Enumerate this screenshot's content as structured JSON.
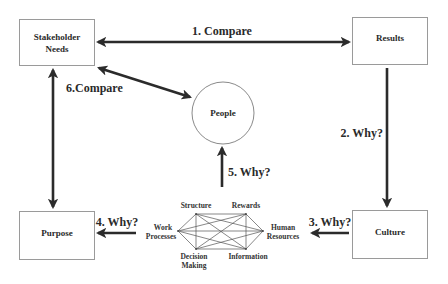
{
  "diagram": {
    "nodes": {
      "stakeholder_needs": {
        "line1": "Stakeholder",
        "line2": "Needs"
      },
      "results": {
        "label": "Results"
      },
      "purpose": {
        "label": "Purpose"
      },
      "culture": {
        "label": "Culture"
      },
      "people": {
        "label": "People"
      }
    },
    "edges": {
      "compare_1": {
        "label": "1. Compare",
        "from": "Stakeholder Needs",
        "to": "Results",
        "direction": "both"
      },
      "why_2": {
        "label": "2. Why?",
        "from": "Results",
        "to": "Culture",
        "direction": "forward"
      },
      "why_3": {
        "label": "3. Why?",
        "from": "Culture",
        "to": "Organization Elements",
        "direction": "forward"
      },
      "why_4": {
        "label": "4. Why?",
        "from": "Organization Elements",
        "to": "Purpose",
        "direction": "forward"
      },
      "why_5": {
        "label": "5. Why?",
        "from": "Organization Elements",
        "to": "People",
        "direction": "forward"
      },
      "compare_6": {
        "label": "6.Compare",
        "from": "Stakeholder Needs",
        "to": "People",
        "direction": "both"
      },
      "purpose_link": {
        "label": "",
        "from": "Stakeholder Needs",
        "to": "Purpose",
        "direction": "both"
      }
    },
    "hexagon": {
      "structure": "Structure",
      "rewards": "Rewards",
      "work_processes_1": "Work",
      "work_processes_2": "Processes",
      "human_resources_1": "Human",
      "human_resources_2": "Resources",
      "decision_making_1": "Decision",
      "decision_making_2": "Making",
      "information": "Information",
      "connectivity": "fully-connected"
    },
    "colors": {
      "arrow": "#2b2b2b",
      "box_border": "#9a9a9a",
      "text": "#2a2a2a"
    }
  }
}
